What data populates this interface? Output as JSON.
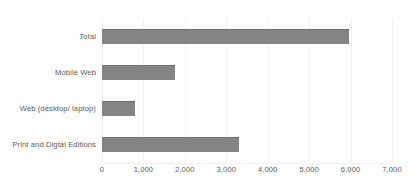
{
  "chart_data": {
    "type": "bar",
    "orientation": "horizontal",
    "title": "",
    "xlabel": "",
    "ylabel": "",
    "categories": [
      "Total",
      "Mobile Web",
      "Web (desktop/ laptop)",
      "Print and Digtal Editions"
    ],
    "values": [
      5950,
      1750,
      800,
      3300
    ],
    "series": [
      {
        "name": "",
        "values": [
          5950,
          1750,
          800,
          3300
        ]
      }
    ],
    "xlim": [
      0,
      7000
    ],
    "xticks": [
      0,
      1000,
      2000,
      3000,
      4000,
      5000,
      6000,
      7000
    ],
    "xticklabels": [
      "0",
      "1,000",
      "2,000",
      "3,000",
      "4,000",
      "5,000",
      "6,000",
      "7,000"
    ],
    "grid": true,
    "grid_axis": "x",
    "legend": false,
    "legend_position": "none",
    "bar_color": "#848484",
    "gridline_color": "#f0f0f0",
    "text_color": "#5a5a5a",
    "background_color": "#ffffff"
  }
}
